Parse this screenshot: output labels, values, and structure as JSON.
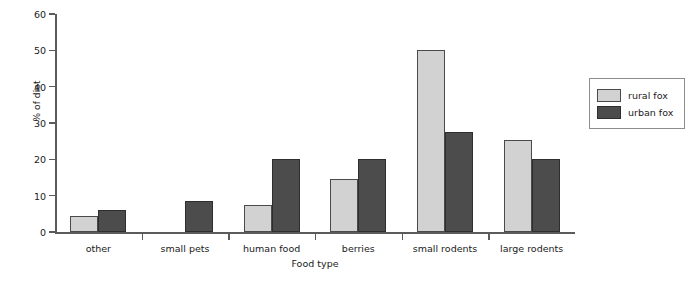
{
  "chart_data": {
    "type": "bar",
    "title": "",
    "xlabel": "Food type",
    "ylabel": "% of diet",
    "categories": [
      "other",
      "small pets",
      "human food",
      "berries",
      "small rodents",
      "large rodents"
    ],
    "series": [
      {
        "name": "rural fox",
        "color": "#d2d2d2",
        "values": [
          4.5,
          0,
          7.3,
          14.5,
          50.0,
          25.3
        ]
      },
      {
        "name": "urban fox",
        "color": "#4c4c4c",
        "values": [
          6.0,
          8.5,
          20.0,
          20.2,
          27.5,
          20.2
        ]
      }
    ],
    "ylim": [
      0,
      60
    ],
    "yticks": [
      0,
      10,
      20,
      30,
      40,
      50,
      60
    ],
    "ytick_labels": [
      "0",
      "10",
      "20",
      "30",
      "40",
      "50",
      "60"
    ],
    "grid": false,
    "legend_position": "right"
  },
  "legend": {
    "entries": [
      {
        "label": "rural fox"
      },
      {
        "label": "urban fox"
      }
    ]
  }
}
